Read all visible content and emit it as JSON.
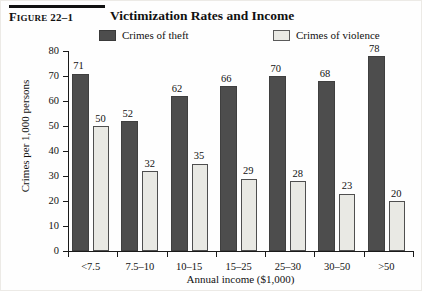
{
  "figure": {
    "number": "Figure 22–1",
    "number_word": "Figure",
    "number_value": "22–1",
    "title": "Victimization Rates and Income"
  },
  "legend": {
    "items": [
      {
        "label": "Crimes of theft",
        "color": "#4d4d4d",
        "swatch": "dark-swatch"
      },
      {
        "label": "Crimes of violence",
        "color": "#e9e9e4",
        "swatch": "light-swatch"
      }
    ]
  },
  "chart_data": {
    "type": "bar",
    "title": "Victimization Rates and Income",
    "xlabel": "Annual income ($1,000)",
    "ylabel": "Crimes per 1,000 persons",
    "ylim": [
      0,
      80
    ],
    "yticks": [
      0,
      10,
      20,
      30,
      40,
      50,
      60,
      70,
      80
    ],
    "grid": false,
    "legend_position": "top",
    "categories": [
      "<7.5",
      "7.5–10",
      "10–15",
      "15–25",
      "25–30",
      "30–50",
      ">50"
    ],
    "series": [
      {
        "name": "Crimes of theft",
        "color": "#4d4d4d",
        "values": [
          71,
          52,
          62,
          66,
          70,
          68,
          78
        ]
      },
      {
        "name": "Crimes of violence",
        "color": "#e9e9e4",
        "values": [
          50,
          32,
          35,
          29,
          28,
          23,
          20
        ]
      }
    ]
  }
}
